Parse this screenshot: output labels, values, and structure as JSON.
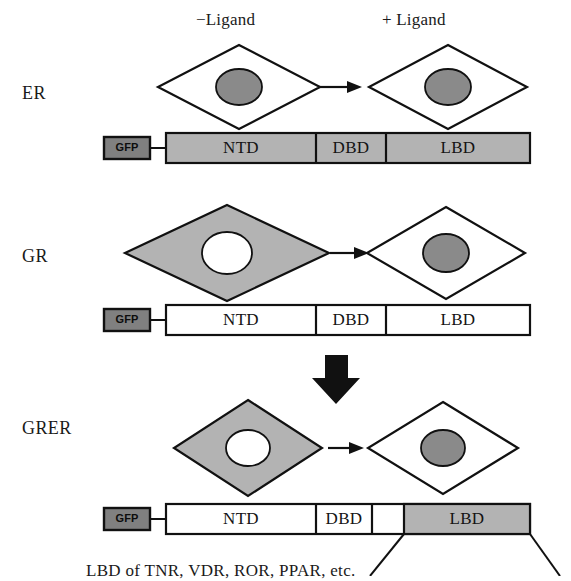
{
  "figure": {
    "headers": {
      "minus_ligand": "−Ligand",
      "plus_ligand": "+ Ligand"
    },
    "rows": [
      {
        "id": "er",
        "label": "ER",
        "minus_ligand_cell": {
          "diamond_fill": "white",
          "nucleus_fill": "gray",
          "description": "nuclear localization"
        },
        "plus_ligand_cell": {
          "diamond_fill": "white",
          "nucleus_fill": "gray",
          "description": "nuclear localization"
        },
        "construct": {
          "tag": "GFP",
          "tag_fill": "dark-gray",
          "segments": [
            {
              "label": "NTD",
              "fill": "gray"
            },
            {
              "label": "DBD",
              "fill": "gray"
            },
            {
              "label": "LBD",
              "fill": "gray"
            }
          ]
        }
      },
      {
        "id": "gr",
        "label": "GR",
        "minus_ligand_cell": {
          "diamond_fill": "gray",
          "nucleus_fill": "white",
          "description": "cytoplasmic localization"
        },
        "plus_ligand_cell": {
          "diamond_fill": "white",
          "nucleus_fill": "gray",
          "description": "nuclear localization"
        },
        "construct": {
          "tag": "GFP",
          "tag_fill": "dark-gray",
          "segments": [
            {
              "label": "NTD",
              "fill": "white"
            },
            {
              "label": "DBD",
              "fill": "white"
            },
            {
              "label": "LBD",
              "fill": "white"
            }
          ]
        }
      },
      {
        "id": "grer",
        "label": "GRER",
        "minus_ligand_cell": {
          "diamond_fill": "gray",
          "nucleus_fill": "white",
          "description": "cytoplasmic localization"
        },
        "plus_ligand_cell": {
          "diamond_fill": "white",
          "nucleus_fill": "gray",
          "description": "nuclear localization"
        },
        "construct": {
          "tag": "GFP",
          "tag_fill": "dark-gray",
          "segments": [
            {
              "label": "NTD",
              "fill": "white"
            },
            {
              "label": "DBD",
              "fill": "white"
            },
            {
              "label": "",
              "fill": "white"
            },
            {
              "label": "LBD",
              "fill": "gray"
            }
          ]
        }
      }
    ],
    "caption": "LBD of TNR, VDR, ROR, PPAR, etc.",
    "colors": {
      "outline": "#111111",
      "gray_fill": "#b3b3b3",
      "dark_gray_fill": "#808080",
      "nucleus_gray": "#8a8a8a",
      "white_fill": "#ffffff",
      "background": "#ffffff"
    }
  }
}
